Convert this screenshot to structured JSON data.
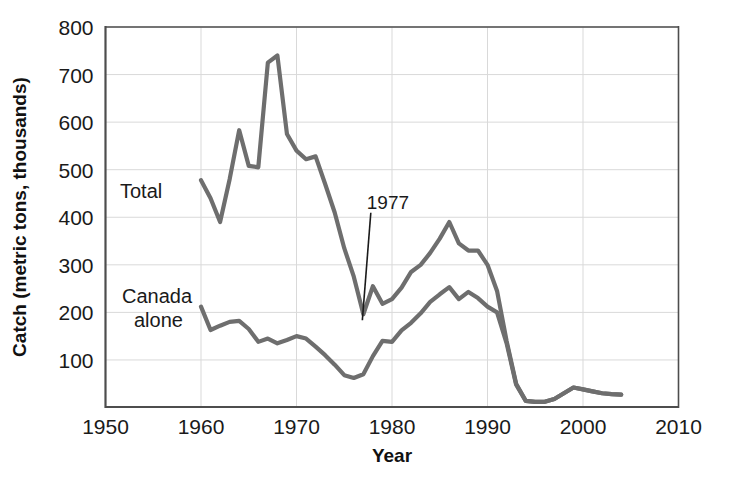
{
  "chart_data": {
    "type": "line",
    "title": "",
    "xlabel": "Year",
    "ylabel": "Catch (metric tons, thousands)",
    "xlim": [
      1950,
      2010
    ],
    "ylim": [
      0,
      800
    ],
    "xticks": [
      1950,
      1960,
      1970,
      1980,
      1990,
      2000,
      2010
    ],
    "yticks": [
      100,
      200,
      300,
      400,
      500,
      600,
      700,
      800
    ],
    "grid": true,
    "legend_position": "inline-labels",
    "line_color": "#6e6e6e",
    "axis_color": "#4d4d4d",
    "grid_color": "#d9d9d9",
    "annotations": [
      {
        "text": "1977",
        "x": 1977,
        "y": 196,
        "label_x": 1978.2,
        "label_y": 418
      }
    ],
    "series": [
      {
        "name": "Total",
        "label": "Total",
        "label_x": 1957.4,
        "label_y": 455,
        "x": [
          1960,
          1961,
          1962,
          1963,
          1964,
          1965,
          1966,
          1967,
          1968,
          1969,
          1970,
          1971,
          1972,
          1973,
          1974,
          1975,
          1976,
          1977,
          1978,
          1979,
          1980,
          1981,
          1982,
          1983,
          1984,
          1985,
          1986,
          1987,
          1988,
          1989,
          1990,
          1991,
          1992,
          1993,
          1994,
          1995,
          1996,
          1997,
          1998,
          1999,
          2000,
          2001,
          2002,
          2003,
          2004
        ],
        "values": [
          478,
          440,
          390,
          480,
          583,
          508,
          505,
          725,
          740,
          575,
          540,
          522,
          528,
          470,
          410,
          335,
          275,
          196,
          255,
          218,
          228,
          252,
          285,
          300,
          325,
          355,
          390,
          345,
          330,
          330,
          300,
          245,
          140,
          50,
          14,
          12,
          12,
          18,
          30,
          42,
          38,
          34,
          30,
          28,
          27
        ]
      },
      {
        "name": "Canada alone",
        "label": "Canada\nalone",
        "label_line_1": "Canada",
        "label_line_2": "alone",
        "label_x": 1957.6,
        "label_y": 262,
        "x": [
          1960,
          1961,
          1962,
          1963,
          1964,
          1965,
          1966,
          1967,
          1968,
          1969,
          1970,
          1971,
          1972,
          1973,
          1974,
          1975,
          1976,
          1977,
          1978,
          1979,
          1980,
          1981,
          1982,
          1983,
          1984,
          1985,
          1986,
          1987,
          1988,
          1989,
          1990,
          1991,
          1992,
          1993,
          1994,
          1995,
          1996,
          1997,
          1998,
          1999,
          2000,
          2001,
          2002,
          2003,
          2004
        ],
        "values": [
          212,
          163,
          172,
          180,
          182,
          165,
          138,
          145,
          135,
          142,
          150,
          145,
          128,
          110,
          90,
          68,
          62,
          70,
          108,
          140,
          138,
          162,
          178,
          198,
          222,
          238,
          253,
          228,
          243,
          230,
          212,
          200,
          135,
          48,
          14,
          12,
          12,
          18,
          30,
          42,
          38,
          34,
          30,
          28,
          27
        ]
      }
    ]
  },
  "axes": {
    "x_title": "Year",
    "y_title": "Catch (metric tons, thousands)",
    "x_tick_labels": [
      "1950",
      "1960",
      "1970",
      "1980",
      "1990",
      "2000",
      "2010"
    ],
    "y_tick_labels": [
      "100",
      "200",
      "300",
      "400",
      "500",
      "600",
      "700",
      "800"
    ]
  },
  "labels": {
    "total": "Total",
    "canada_line1": "Canada",
    "canada_line2": "alone",
    "annotation_1977": "1977"
  }
}
